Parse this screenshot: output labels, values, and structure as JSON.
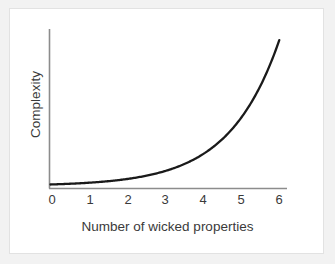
{
  "chart_data": {
    "type": "line",
    "title": "",
    "xlabel": "Number of wicked properties",
    "ylabel": "Complexity",
    "xticklabels": [
      "0",
      "1",
      "2",
      "3",
      "4",
      "5",
      "6"
    ],
    "x": [
      0,
      0.5,
      1,
      1.5,
      2,
      2.5,
      3,
      3.5,
      4,
      4.5,
      5,
      5.5,
      6
    ],
    "values": [
      1.0,
      1.8,
      3.0,
      4.6,
      6.8,
      9.8,
      13.8,
      19.2,
      26.5,
      36.5,
      50.0,
      68.5,
      96.0
    ],
    "xlim": [
      0,
      6.15
    ],
    "ylim": [
      0,
      100
    ],
    "grid": false,
    "legend": null,
    "yticklabels": [],
    "annotations": [],
    "series_name": "Complexity vs number of wicked properties",
    "curve_description": "Monotonically increasing exponential curve, nearly flat near zero and rising steeply toward six",
    "line_color": "#1a1a1a",
    "axis_color": "#8c8c8c",
    "background_color": "#ffffff",
    "page_background_color": "#f2f2f2",
    "border_color": "#e2e2e2"
  }
}
